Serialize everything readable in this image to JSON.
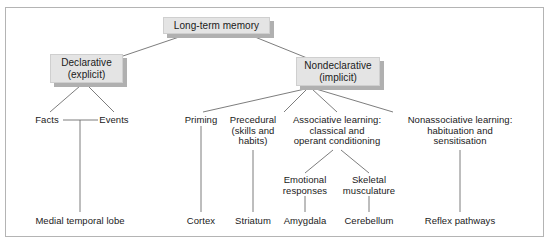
{
  "figure": {
    "background_color": "#ffffff",
    "frame_color": "#b4b4b4",
    "box_fill": "#e4e4e4",
    "box_shadow": "#b0b0b0",
    "line_color": "#6e6e6e",
    "text_color": "#1a1a1a"
  },
  "boxes": {
    "root": "Long-term memory",
    "declarative": "Declarative\n(explicit)",
    "nondeclarative": "Nondeclarative\n(implicit)"
  },
  "branches": {
    "facts": "Facts",
    "events": "Events",
    "priming": "Priming",
    "procedural": "Precedural\n(skills and\nhabits)",
    "associative": "Associative learning:\nclassical and\noperant conditioning",
    "nonassociative": "Nonassociative learning:\nhabituation and\nsensitisation",
    "emotional": "Emotional\nresponses",
    "skeletal": "Skeletal\nmusculature"
  },
  "structures": {
    "medial_temporal_lobe": "Medial temporal lobe",
    "cortex": "Cortex",
    "striatum": "Striatum",
    "amygdala": "Amygdala",
    "cerebellum": "Cerebellum",
    "reflex_pathways": "Reflex pathways"
  }
}
